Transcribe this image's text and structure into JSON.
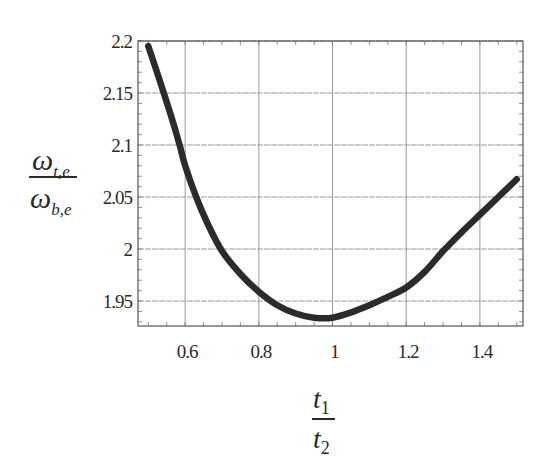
{
  "chart_data": {
    "type": "line",
    "title": "",
    "xlabel": "t1 / t2",
    "ylabel": "ω_t,e / ω_b,e",
    "xlim": [
      0.472,
      1.517
    ],
    "ylim": [
      1.926,
      2.2
    ],
    "grid": true,
    "legend": null,
    "x_ticks": [
      0.6,
      0.8,
      1.0,
      1.2,
      1.4
    ],
    "x_tick_labels": [
      "0.6",
      "0.8",
      "1",
      "1.2",
      "1.4"
    ],
    "y_ticks": [
      1.95,
      2.0,
      2.05,
      2.1,
      2.15,
      2.2
    ],
    "y_tick_labels": [
      "1.95",
      "2",
      "2.05",
      "2.1",
      "2.15",
      "2.2"
    ],
    "series": [
      {
        "name": "omega_ratio",
        "color": "#2b2b2b",
        "x": [
          0.5,
          0.53,
          0.56,
          0.585,
          0.6,
          0.63,
          0.66,
          0.7,
          0.75,
          0.8,
          0.85,
          0.9,
          0.95,
          1.0,
          1.05,
          1.1,
          1.15,
          1.2,
          1.25,
          1.3,
          1.35,
          1.4,
          1.45,
          1.5
        ],
        "y": [
          2.195,
          2.163,
          2.13,
          2.1,
          2.08,
          2.05,
          2.025,
          1.998,
          1.976,
          1.959,
          1.946,
          1.938,
          1.934,
          1.934,
          1.939,
          1.946,
          1.954,
          1.963,
          1.978,
          1.998,
          2.016,
          2.033,
          2.05,
          2.067
        ]
      }
    ]
  },
  "labels": {
    "y_numerator_sym": "ω",
    "y_numerator_sub": "t,e",
    "y_denominator_sym": "ω",
    "y_denominator_sub": "b,e",
    "x_numerator_sym": "t",
    "x_numerator_sub": "1",
    "x_denominator_sym": "t",
    "x_denominator_sub": "2"
  }
}
